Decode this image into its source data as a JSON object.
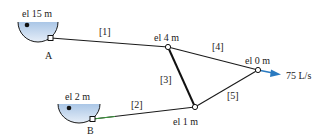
{
  "reservoirs": [
    {
      "id": "A",
      "label": "A",
      "elevation": "el 15 m"
    },
    {
      "id": "B",
      "label": "B",
      "elevation": "el 2 m"
    }
  ],
  "junctions": [
    {
      "id": "J1",
      "elevation": "el 4 m"
    },
    {
      "id": "J2",
      "elevation": "el 0 m"
    },
    {
      "id": "J3",
      "elevation": "el 1 m"
    }
  ],
  "pipes": [
    {
      "id": "1",
      "label": "[1]"
    },
    {
      "id": "2",
      "label": "[2]"
    },
    {
      "id": "3",
      "label": "[3]"
    },
    {
      "id": "4",
      "label": "[4]"
    },
    {
      "id": "5",
      "label": "[5]"
    }
  ],
  "outflow": {
    "label": "75 L/s",
    "color": "#2a7ac0"
  },
  "colors": {
    "water_top": "#b7cfe8",
    "water_bottom": "#e3edf7",
    "line": "#1a1a1a"
  }
}
